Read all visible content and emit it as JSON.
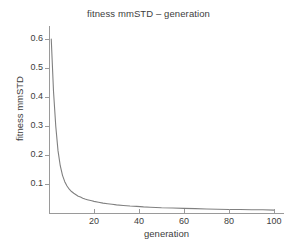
{
  "chart_data": {
    "type": "line",
    "title": "fitness mmSTD – generation",
    "xlabel": "generation",
    "ylabel": "fitness mmSTD",
    "xlim": [
      0,
      104
    ],
    "ylim": [
      0,
      0.645
    ],
    "grid": false,
    "legend": null,
    "line_color": "#808080",
    "axis_color": "#9a9a9a",
    "background_color": "#ffffff",
    "x_ticks": [
      20,
      40,
      60,
      80,
      100
    ],
    "x_tick_labels": [
      "20",
      "40",
      "60",
      "80",
      "100"
    ],
    "y_ticks": [
      0.1,
      0.2,
      0.3,
      0.4,
      0.5,
      0.6
    ],
    "y_tick_labels": [
      "0.1",
      "0.2",
      "0.3",
      "0.4",
      "0.5",
      "0.6"
    ],
    "series": [
      {
        "name": "fitness mmSTD",
        "x": [
          1,
          2,
          3,
          4,
          5,
          6,
          7,
          8,
          9,
          10,
          11,
          12,
          13,
          14,
          15,
          16,
          17,
          18,
          19,
          20,
          22,
          24,
          26,
          28,
          30,
          33,
          36,
          39,
          42,
          45,
          50,
          55,
          60,
          65,
          70,
          75,
          80,
          85,
          90,
          95,
          100
        ],
        "y": [
          0.6,
          0.42,
          0.3,
          0.215,
          0.163,
          0.13,
          0.108,
          0.093,
          0.082,
          0.074,
          0.068,
          0.063,
          0.058,
          0.055,
          0.051,
          0.048,
          0.046,
          0.044,
          0.042,
          0.04,
          0.037,
          0.034,
          0.032,
          0.03,
          0.028,
          0.026,
          0.024,
          0.023,
          0.021,
          0.02,
          0.018,
          0.017,
          0.016,
          0.015,
          0.014,
          0.013,
          0.012,
          0.012,
          0.011,
          0.011,
          0.01
        ]
      }
    ]
  }
}
